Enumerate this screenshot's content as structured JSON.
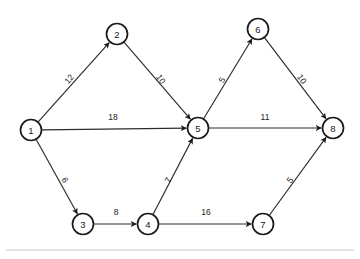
{
  "diagram": {
    "node_radius": 10.5,
    "colors": {
      "node_stroke": "#1a1a1a",
      "node_fill": "#ffffff",
      "edge_stroke": "#2b2b2b",
      "text": "#1a1a1a",
      "rule": "#c8c8c8",
      "background": "#ffffff"
    },
    "nodes": [
      {
        "id": "1",
        "label": "1",
        "x": 31,
        "y": 130
      },
      {
        "id": "2",
        "label": "2",
        "x": 117,
        "y": 34
      },
      {
        "id": "3",
        "label": "3",
        "x": 83,
        "y": 224
      },
      {
        "id": "4",
        "label": "4",
        "x": 148,
        "y": 224
      },
      {
        "id": "5",
        "label": "5",
        "x": 198,
        "y": 128
      },
      {
        "id": "6",
        "label": "6",
        "x": 258,
        "y": 29
      },
      {
        "id": "7",
        "label": "7",
        "x": 263,
        "y": 224
      },
      {
        "id": "8",
        "label": "8",
        "x": 333,
        "y": 128
      }
    ],
    "edges": [
      {
        "from": "1",
        "to": "2",
        "weight": "12",
        "label_x": 69,
        "label_y": 79,
        "label_rotation": -49
      },
      {
        "from": "2",
        "to": "5",
        "weight": "10",
        "label_x": 161,
        "label_y": 79,
        "label_rotation": 56
      },
      {
        "from": "1",
        "to": "5",
        "weight": "18",
        "label_x": 113,
        "label_y": 117,
        "label_rotation": 0
      },
      {
        "from": "1",
        "to": "3",
        "weight": "6",
        "label_x": 65,
        "label_y": 180,
        "label_rotation": 62
      },
      {
        "from": "3",
        "to": "4",
        "weight": "8",
        "label_x": 116,
        "label_y": 212,
        "label_rotation": 0
      },
      {
        "from": "4",
        "to": "5",
        "weight": "7",
        "label_x": 168,
        "label_y": 180,
        "label_rotation": -62
      },
      {
        "from": "4",
        "to": "7",
        "weight": "16",
        "label_x": 206,
        "label_y": 212,
        "label_rotation": 0
      },
      {
        "from": "5",
        "to": "6",
        "weight": "5",
        "label_x": 222,
        "label_y": 80,
        "label_rotation": -58
      },
      {
        "from": "5",
        "to": "8",
        "weight": "11",
        "label_x": 265,
        "label_y": 117,
        "label_rotation": 0
      },
      {
        "from": "6",
        "to": "8",
        "weight": "10",
        "label_x": 302,
        "label_y": 79,
        "label_rotation": 55
      },
      {
        "from": "7",
        "to": "8",
        "weight": "5",
        "label_x": 290,
        "label_y": 180,
        "label_rotation": -55
      }
    ],
    "rules": [
      {
        "x1": 6,
        "y1": 250,
        "x2": 354,
        "y2": 250
      }
    ]
  }
}
